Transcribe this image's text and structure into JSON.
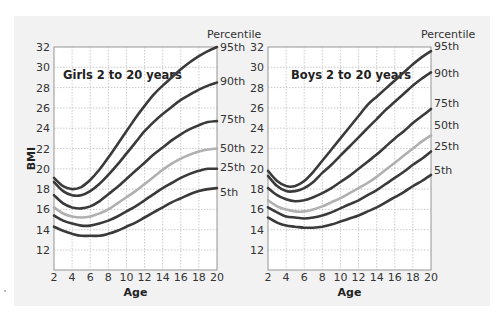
{
  "colors": {
    "panel_bg": "#f2f2f2",
    "plot_bg": "#ffffff",
    "curve_dark": "#3a3a3a",
    "curve_median": "#b0b0b0",
    "grid": "#b5b5b5"
  },
  "chart_data": [
    {
      "type": "line",
      "title": "Girls 2 to 20 years",
      "xlabel": "Age",
      "ylabel": "BMI",
      "legend_title": "Percentile",
      "xlim": [
        2,
        20
      ],
      "ylim": [
        10,
        32
      ],
      "xticks": [
        2,
        4,
        6,
        8,
        10,
        12,
        14,
        16,
        18,
        20
      ],
      "yticks": [
        12,
        14,
        16,
        18,
        20,
        22,
        24,
        26,
        28,
        30,
        32
      ],
      "grid": true,
      "legend_position": "right",
      "x": [
        2,
        3,
        4,
        5,
        6,
        7,
        8,
        9,
        10,
        11,
        12,
        13,
        14,
        15,
        16,
        17,
        18,
        19,
        20
      ],
      "series": [
        {
          "name": "95th",
          "values": [
            19.1,
            18.3,
            18.0,
            18.2,
            18.9,
            19.9,
            21.1,
            22.4,
            23.7,
            25.0,
            26.2,
            27.3,
            28.2,
            29.0,
            29.8,
            30.5,
            31.1,
            31.6,
            32.0
          ]
        },
        {
          "name": "90th",
          "values": [
            18.7,
            17.8,
            17.4,
            17.4,
            17.8,
            18.5,
            19.4,
            20.4,
            21.5,
            22.6,
            23.7,
            24.6,
            25.4,
            26.1,
            26.8,
            27.3,
            27.8,
            28.2,
            28.5
          ]
        },
        {
          "name": "75th",
          "values": [
            17.4,
            16.6,
            16.2,
            16.1,
            16.3,
            16.8,
            17.5,
            18.2,
            19.0,
            19.8,
            20.6,
            21.4,
            22.1,
            22.8,
            23.4,
            23.9,
            24.3,
            24.6,
            24.7
          ]
        },
        {
          "name": "50th",
          "values": [
            16.2,
            15.6,
            15.3,
            15.2,
            15.3,
            15.6,
            16.0,
            16.6,
            17.2,
            17.8,
            18.5,
            19.2,
            19.9,
            20.5,
            21.0,
            21.4,
            21.7,
            21.9,
            22.0
          ]
        },
        {
          "name": "25th",
          "values": [
            15.4,
            14.9,
            14.6,
            14.4,
            14.4,
            14.6,
            14.9,
            15.3,
            15.8,
            16.3,
            16.9,
            17.5,
            18.1,
            18.6,
            19.1,
            19.5,
            19.8,
            20.0,
            20.0
          ]
        },
        {
          "name": "5th",
          "values": [
            14.3,
            13.9,
            13.6,
            13.4,
            13.4,
            13.4,
            13.6,
            13.9,
            14.3,
            14.7,
            15.2,
            15.7,
            16.2,
            16.7,
            17.1,
            17.5,
            17.8,
            18.0,
            18.1
          ]
        }
      ]
    },
    {
      "type": "line",
      "title": "Boys 2 to 20 years",
      "xlabel": "Age",
      "ylabel": "",
      "legend_title": "Percentile",
      "xlim": [
        2,
        20
      ],
      "ylim": [
        10,
        32
      ],
      "xticks": [
        2,
        4,
        6,
        8,
        10,
        12,
        14,
        16,
        18,
        20
      ],
      "yticks": [
        12,
        14,
        16,
        18,
        20,
        22,
        24,
        26,
        28,
        30,
        32
      ],
      "grid": true,
      "legend_position": "right",
      "x": [
        2,
        3,
        4,
        5,
        6,
        7,
        8,
        9,
        10,
        11,
        12,
        13,
        14,
        15,
        16,
        17,
        18,
        19,
        20
      ],
      "series": [
        {
          "name": "95th",
          "values": [
            19.8,
            18.8,
            18.3,
            18.3,
            18.8,
            19.7,
            20.8,
            21.9,
            23.0,
            24.1,
            25.2,
            26.3,
            27.1,
            27.9,
            28.7,
            29.5,
            30.3,
            31.0,
            31.6
          ]
        },
        {
          "name": "90th",
          "values": [
            19.3,
            18.3,
            17.8,
            17.8,
            18.1,
            18.7,
            19.6,
            20.4,
            21.3,
            22.2,
            23.1,
            24.0,
            24.9,
            25.8,
            26.6,
            27.4,
            28.2,
            28.9,
            29.5
          ]
        },
        {
          "name": "75th",
          "values": [
            18.1,
            17.4,
            17.0,
            16.8,
            16.9,
            17.2,
            17.6,
            18.1,
            18.7,
            19.3,
            20.0,
            20.7,
            21.4,
            22.2,
            23.0,
            23.7,
            24.5,
            25.2,
            25.9
          ]
        },
        {
          "name": "50th",
          "values": [
            16.9,
            16.3,
            16.0,
            15.8,
            15.8,
            16.0,
            16.3,
            16.7,
            17.1,
            17.6,
            18.1,
            18.6,
            19.2,
            19.9,
            20.6,
            21.3,
            22.0,
            22.7,
            23.3
          ]
        },
        {
          "name": "25th",
          "values": [
            16.2,
            15.7,
            15.3,
            15.2,
            15.1,
            15.2,
            15.4,
            15.7,
            16.1,
            16.5,
            16.9,
            17.4,
            17.9,
            18.5,
            19.1,
            19.7,
            20.4,
            21.0,
            21.7
          ]
        },
        {
          "name": "5th",
          "values": [
            15.2,
            14.7,
            14.4,
            14.3,
            14.2,
            14.2,
            14.3,
            14.5,
            14.8,
            15.1,
            15.4,
            15.8,
            16.2,
            16.7,
            17.2,
            17.7,
            18.3,
            18.8,
            19.4
          ]
        }
      ]
    }
  ],
  "label_offsets": [
    {
      "95th": 47,
      "90th": 81,
      "75th": 119,
      "50th": 148,
      "25th": 167,
      "5th": 192
    },
    {
      "95th": 46,
      "90th": 73,
      "75th": 103,
      "50th": 125,
      "25th": 146,
      "5th": 170
    }
  ]
}
